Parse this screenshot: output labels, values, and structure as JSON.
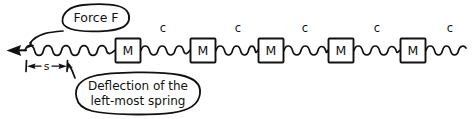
{
  "figure": {
    "name": "mass-spring-chain-diagram",
    "style": "hand-drawn-sketch",
    "background_color": "#ffffff",
    "ink_color": "#111111",
    "width": 472,
    "height": 119
  },
  "annotations": {
    "force_callout": {
      "label": "Force F",
      "shape": "ellipse",
      "leader": "curved-line-to-arrow-tail"
    },
    "deflection_callout": {
      "label_line_1": "Deflection of the",
      "label_line_2": "left-most spring",
      "shape": "rounded-ellipse",
      "leader": "line-to-dimension-tick"
    }
  },
  "dimension": {
    "label": "s",
    "meaning": "deflection-of-left-most-spring",
    "style": "double-headed-arrow-with-end-ticks"
  },
  "force_arrow": {
    "direction": "left",
    "label": "Force F"
  },
  "masses": [
    {
      "label": "M",
      "x": 115
    },
    {
      "label": "M",
      "x": 190
    },
    {
      "label": "M",
      "x": 258
    },
    {
      "label": "M",
      "x": 328
    },
    {
      "label": "M",
      "x": 400
    }
  ],
  "springs": [
    {
      "label": "",
      "x1": 25,
      "x2": 115,
      "coils": 9,
      "labeled": false
    },
    {
      "label": "c",
      "x1": 141,
      "x2": 190,
      "coils": 7,
      "labeled": true
    },
    {
      "label": "c",
      "x1": 216,
      "x2": 258,
      "coils": 7,
      "labeled": true
    },
    {
      "label": "c",
      "x1": 284,
      "x2": 328,
      "coils": 7,
      "labeled": true
    },
    {
      "label": "c",
      "x1": 354,
      "x2": 400,
      "coils": 7,
      "labeled": true
    },
    {
      "label": "c",
      "x1": 426,
      "x2": 466,
      "coils": 6,
      "labeled": true
    }
  ],
  "spring_labels": [
    {
      "text": "c",
      "x": 163
    },
    {
      "text": "c",
      "x": 238
    },
    {
      "text": "c",
      "x": 305
    },
    {
      "text": "c",
      "x": 377
    },
    {
      "text": "c",
      "x": 450
    }
  ]
}
